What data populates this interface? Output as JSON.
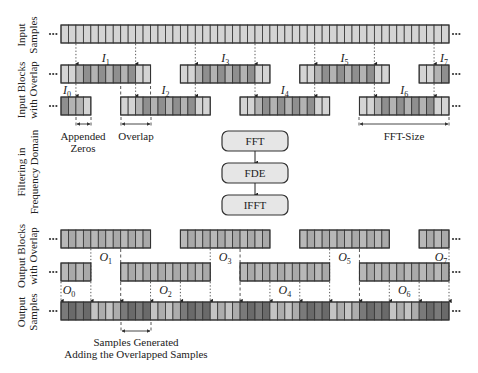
{
  "figure": {
    "row_labels": {
      "input_samples": [
        "Input",
        "Samples"
      ],
      "input_blocks": [
        "Input Blocks",
        "with Overlap"
      ],
      "filtering": [
        "Filtering in",
        "Frequency Domain"
      ],
      "output_blocks": [
        "Output Blocks",
        "with Overlap"
      ],
      "output_samples": [
        "Output",
        "Samples"
      ]
    },
    "ellipsis": "...",
    "process_steps": [
      "FFT",
      "FDE",
      "IFFT"
    ],
    "annotations": {
      "appended_zeros": [
        "Appended",
        "Zeros"
      ],
      "overlap": "Overlap",
      "fft_size": "FFT-Size",
      "samples_generated": [
        "Samples Generated",
        "Adding the Overlapped Samples"
      ]
    },
    "input_blocks": [
      {
        "name": "I",
        "sub": "0",
        "row": 1,
        "start": 0,
        "len": 4
      },
      {
        "name": "I",
        "sub": "1",
        "row": 0,
        "start": 0,
        "len": 12
      },
      {
        "name": "I",
        "sub": "2",
        "row": 1,
        "start": 8,
        "len": 12
      },
      {
        "name": "I",
        "sub": "3",
        "row": 0,
        "start": 16,
        "len": 12
      },
      {
        "name": "I",
        "sub": "4",
        "row": 1,
        "start": 24,
        "len": 12
      },
      {
        "name": "I",
        "sub": "5",
        "row": 0,
        "start": 32,
        "len": 12
      },
      {
        "name": "I",
        "sub": "6",
        "row": 1,
        "start": 40,
        "len": 12
      },
      {
        "name": "I",
        "sub": "7",
        "row": 0,
        "start": 48,
        "len": 4
      }
    ],
    "output_blocks": [
      {
        "name": "O",
        "sub": "0",
        "row": 1,
        "start": 0,
        "len": 4
      },
      {
        "name": "O",
        "sub": "1",
        "row": 0,
        "start": 0,
        "len": 12
      },
      {
        "name": "O",
        "sub": "2",
        "row": 1,
        "start": 8,
        "len": 12
      },
      {
        "name": "O",
        "sub": "3",
        "row": 0,
        "start": 16,
        "len": 12
      },
      {
        "name": "O",
        "sub": "4",
        "row": 1,
        "start": 24,
        "len": 12
      },
      {
        "name": "O",
        "sub": "5",
        "row": 0,
        "start": 32,
        "len": 12
      },
      {
        "name": "O",
        "sub": "6",
        "row": 1,
        "start": 40,
        "len": 12
      },
      {
        "name": "O",
        "sub": "7",
        "row": 0,
        "start": 48,
        "len": 4
      }
    ],
    "total_cells": 52,
    "colors": {
      "light": "#d4d4d4",
      "mid": "#b3b3b3",
      "dark": "#8f8f8f",
      "darker": "#6e6e6e",
      "output_light": "#b8b8b8",
      "output_dark": "#7a7a7a",
      "stroke": "#333333",
      "box_fill": "#e6e6e6"
    }
  }
}
